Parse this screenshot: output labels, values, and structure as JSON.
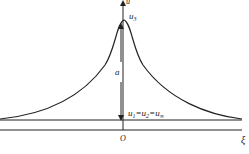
{
  "diagram": {
    "type": "soliton-profile",
    "axes": {
      "vertical_label": "u",
      "horizontal_label": "ξ",
      "origin_label": "O"
    },
    "labels": {
      "peak": "u",
      "peak_sub": "3",
      "amplitude": "a",
      "base_u1": "u",
      "base_u1_sub": "1",
      "eq1": "=",
      "base_u2": "u",
      "base_u2_sub": "2",
      "eq2": "=",
      "base_uinf": "u",
      "base_uinf_sub": "∞"
    },
    "colors": {
      "stroke": "#222222",
      "background": "#ffffff"
    }
  }
}
